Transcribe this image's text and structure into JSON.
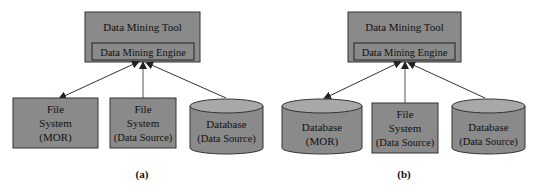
{
  "colors": {
    "box_fill": "#8a8a8a",
    "box_stroke": "#333333",
    "cyl_top": "#a8a8a8",
    "arrow": "#333333"
  },
  "diagrams": [
    {
      "caption": "(a)",
      "tool": {
        "title": "Data Mining Tool",
        "engine": "Data Mining Engine"
      },
      "nodes": [
        {
          "shape": "box",
          "lines": [
            "File",
            "System",
            "(MOR)"
          ]
        },
        {
          "shape": "box",
          "lines": [
            "File",
            "System",
            "(Data Source)"
          ]
        },
        {
          "shape": "cylinder",
          "lines": [
            "Database",
            "(Data Source)"
          ]
        }
      ]
    },
    {
      "caption": "(b)",
      "tool": {
        "title": "Data Mining Tool",
        "engine": "Data Mining Engine"
      },
      "nodes": [
        {
          "shape": "cylinder",
          "lines": [
            "Database",
            "(MOR)"
          ]
        },
        {
          "shape": "box",
          "lines": [
            "File",
            "System",
            "(Data Source)"
          ]
        },
        {
          "shape": "cylinder",
          "lines": [
            "Database",
            "(Data Source)"
          ]
        }
      ]
    }
  ]
}
